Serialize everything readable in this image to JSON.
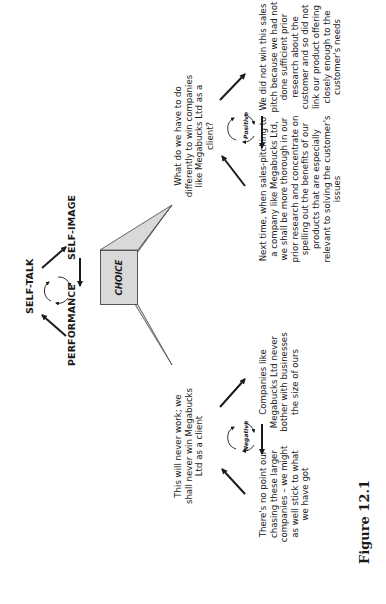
{
  "top_cycle": {
    "self_talk": "SELF-TALK",
    "self_image": "SELF-IMAGE",
    "performance": "PERFORMANCE"
  },
  "choice": {
    "label": "CHOICE"
  },
  "positive_cycle": {
    "badge": "Positive",
    "question": "What do we have to do differently to win companies like Megabucks Ltd as a client?",
    "reflection": "We did not win this sales pitch because we had not done sufficient prior research about the customer and so did not link our product offering closely enough to the customer's needs",
    "action": "Next time, when sales-pitching to a company like Megabucks Ltd, we shall be more thorough in our prior research and concentrate on spelling out the benefits of our products that are especially relevant to solving the customer's issues"
  },
  "negative_cycle": {
    "badge": "Negative",
    "belief": "This will never work; we shall never win Megabucks Ltd as a client",
    "excuse": "Companies like Megabucks Ltd never bother with businesses the size of ours",
    "conclusion": "There's no point our chasing these larger companies – we might as well stick to what we have got"
  },
  "caption": {
    "figure": "Figure 12.1"
  },
  "colors": {
    "box_fill": "#d9d9d9",
    "stroke": "#1a1a1a",
    "background": "#ffffff"
  }
}
